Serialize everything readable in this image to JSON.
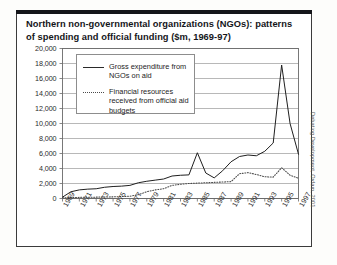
{
  "figure": {
    "title_line_1": "Northern non-governmental organizations (NGOs): patterns",
    "title_line_2": "of spending and official funding ($m, 1969-97)",
    "credit": "Debating Development, Oxfam, 2001"
  },
  "legend": {
    "items": [
      {
        "label": "Gross expenditure from NGOs on aid",
        "style": "solid"
      },
      {
        "label": "Financial resources received from official aid budgets",
        "style": "dotted"
      }
    ]
  },
  "chart_data": {
    "type": "line",
    "title": "Northern non-governmental organizations (NGOs): patterns of spending and official funding ($m, 1969-97)",
    "xlabel": "",
    "ylabel": "",
    "ylim": [
      0,
      20000
    ],
    "ytick_step": 2000,
    "ytick_labels": [
      "20,000",
      "18,000",
      "16,000",
      "14,000",
      "12,000",
      "10,000",
      "8,000",
      "6,000",
      "4,000",
      "2,000",
      "0"
    ],
    "ytick_values": [
      20000,
      18000,
      16000,
      14000,
      12000,
      10000,
      8000,
      6000,
      4000,
      2000,
      0
    ],
    "grid": true,
    "legend_position": "upper-left-inside",
    "x": [
      1969,
      1970,
      1971,
      1972,
      1973,
      1974,
      1975,
      1976,
      1977,
      1978,
      1979,
      1980,
      1981,
      1982,
      1983,
      1984,
      1985,
      1986,
      1987,
      1988,
      1989,
      1990,
      1991,
      1992,
      1993,
      1994,
      1995,
      1996,
      1997
    ],
    "xtick_labels": [
      "1969",
      "1971",
      "1973",
      "1975",
      "1977",
      "1979",
      "1981",
      "1983",
      "1985",
      "1987",
      "1989",
      "1991",
      "1993",
      "1995",
      "1997"
    ],
    "series": [
      {
        "name": "Gross expenditure from NGOs on aid",
        "style": "solid",
        "values": [
          180,
          900,
          1150,
          1250,
          1300,
          1500,
          1600,
          1650,
          1750,
          2100,
          2300,
          2450,
          2600,
          3000,
          3100,
          3150,
          6100,
          3400,
          2750,
          3700,
          4900,
          5600,
          5800,
          5700,
          6300,
          7400,
          17800,
          10000,
          5900
        ]
      },
      {
        "name": "Financial resources received from official aid budgets",
        "style": "dotted",
        "values": [
          100,
          120,
          150,
          170,
          180,
          200,
          220,
          260,
          300,
          500,
          900,
          1150,
          1300,
          1750,
          1900,
          2000,
          2050,
          2100,
          2150,
          2200,
          2250,
          3300,
          3450,
          3200,
          2900,
          2850,
          4100,
          3100,
          2700
        ]
      }
    ]
  }
}
